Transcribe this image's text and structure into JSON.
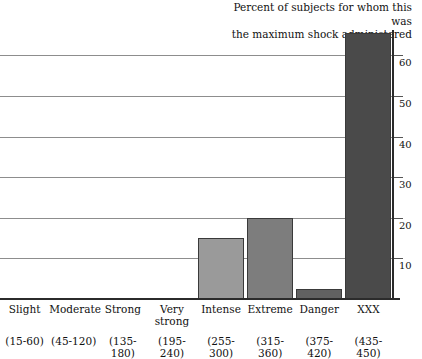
{
  "chart_data": {
    "type": "bar",
    "title": "Percent of subjects for whom this was\nthe maximum shock administered",
    "xlabel": "",
    "ylabel": "",
    "ylim": [
      0,
      68
    ],
    "yticks": [
      10,
      20,
      30,
      40,
      50,
      60
    ],
    "ytick_labels": [
      "10",
      "20",
      "30",
      "40",
      "50",
      "60"
    ],
    "grid": true,
    "legend": "none",
    "categories": [
      "Slight",
      "Moderate",
      "Strong",
      "Very strong",
      "Intense",
      "Extreme",
      "Danger",
      "XXX"
    ],
    "category_sublabels": [
      "(15-60)",
      "(45-120)",
      "(135-180)",
      "(195-240)",
      "(255-300)",
      "(315-360)",
      "(375-420)",
      "(435-450)"
    ],
    "values": [
      0,
      0,
      0,
      0,
      15,
      20,
      2.5,
      65.5
    ],
    "bar_colors": [
      "#9a9a9a",
      "#9a9a9a",
      "#9a9a9a",
      "#9a9a9a",
      "#9a9a9a",
      "#7d7d7d",
      "#616161",
      "#4a4a4a"
    ]
  },
  "axis": {
    "gridline_color": "#8d8d8d",
    "axis_color": "#2b2b2b"
  }
}
